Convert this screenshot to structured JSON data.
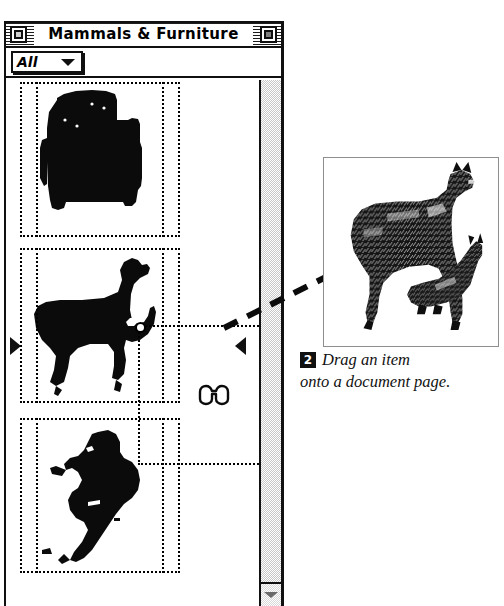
{
  "palette": {
    "title": "Mammals & Furniture",
    "close_box": "close-box",
    "zoom_box": "zoom-box",
    "filter_popup": {
      "value": "All",
      "arrow": "chevron-down-icon",
      "options": [
        "All"
      ]
    },
    "scrollbar": {
      "down_arrow": "scroll-down-arrow"
    },
    "items": [
      {
        "name": "Armchair",
        "art": "armchair-silhouette",
        "selected": true
      },
      {
        "name": "Llama",
        "art": "llama-silhouette",
        "selected": true
      },
      {
        "name": "Gazelle",
        "art": "gazelle-silhouette",
        "selected": false
      }
    ],
    "split_markers": [
      "split-marker-left",
      "split-marker-right"
    ]
  },
  "cursor": {
    "icon": "spectacles-cursor"
  },
  "drag": {
    "arrow": "dashed-drag-arrow",
    "ghost": "drag-ghost-outline"
  },
  "document": {
    "art": "llama-engraving",
    "border_color": "#8e8e8e"
  },
  "caption": {
    "step_number": "2",
    "line1": "Drag an item",
    "line2": "onto a document page."
  },
  "colors": {
    "frame": "#101010",
    "page_border": "#8e8e8e",
    "scroll_track": "#c8c8c8",
    "background": "#ffffff"
  }
}
